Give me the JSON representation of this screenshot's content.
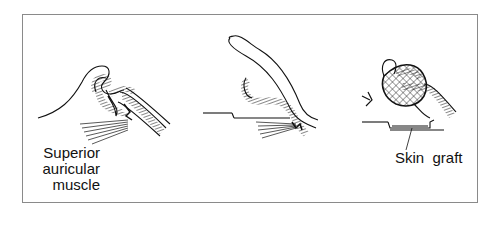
{
  "figure": {
    "panels": [
      {
        "id": "panel-1",
        "description": "Auricle folded with superior auricular muscle fibres"
      },
      {
        "id": "panel-2",
        "description": "Auricle elevated, cartilage sutured to muscle"
      },
      {
        "id": "panel-3",
        "description": "Bolster dressing over skin graft"
      }
    ],
    "labels": {
      "muscle_line1": "Superior",
      "muscle_line2": "auricular",
      "muscle_line3": "muscle",
      "graft": "Skin  graft"
    },
    "colors": {
      "line": "#111111",
      "frame": "#8a8a8a",
      "background": "#ffffff"
    }
  }
}
